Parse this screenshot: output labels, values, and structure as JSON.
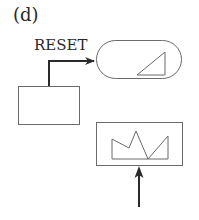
{
  "figure": {
    "panel_label": "(d)",
    "signal_label": "RESET",
    "colors": {
      "stroke": "#3a3a3a",
      "thin_stroke": "#6a6a6a",
      "background": "#ffffff"
    },
    "elements": {
      "source_block": "rectangle",
      "target_block": "rounded-rectangle with ramp waveform",
      "input_block": "rectangle with jagged waveform",
      "input_arrow": "upward arrow"
    }
  }
}
